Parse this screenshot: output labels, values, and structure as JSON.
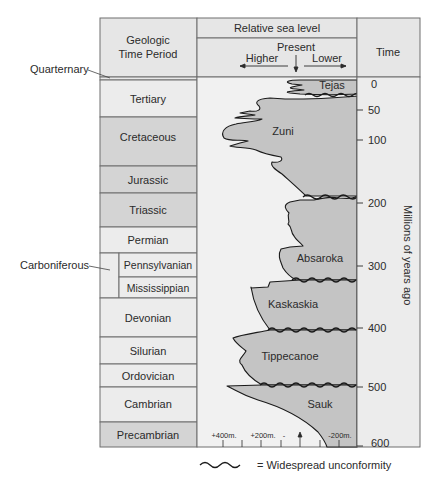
{
  "header": {
    "period_column": [
      "Geologic",
      "Time Period"
    ],
    "sea_level_title": "Relative sea level",
    "present_label": "Present",
    "higher_label": "Higher",
    "lower_label": "Lower",
    "time_label": "Time"
  },
  "side_labels": {
    "quaternary": "Quarternary",
    "carboniferous": "Carboniferous"
  },
  "periods": [
    {
      "name": "Tertiary",
      "shade": "light"
    },
    {
      "name": "Cretaceous",
      "shade": "dark"
    },
    {
      "name": "Jurassic",
      "shade": "dark"
    },
    {
      "name": "Triassic",
      "shade": "dark"
    },
    {
      "name": "Permian",
      "shade": "light"
    },
    {
      "name": "Pennsylvanian",
      "shade": "light"
    },
    {
      "name": "Mississippian",
      "shade": "light"
    },
    {
      "name": "Devonian",
      "shade": "light"
    },
    {
      "name": "Silurian",
      "shade": "light"
    },
    {
      "name": "Ordovician",
      "shade": "light"
    },
    {
      "name": "Cambrian",
      "shade": "light"
    },
    {
      "name": "Precambrian",
      "shade": "dark"
    }
  ],
  "sequences": [
    "Tejas",
    "Zuni",
    "Absaroka",
    "Kaskaskia",
    "Tippecanoe",
    "Sauk"
  ],
  "time_axis": {
    "ticks": [
      "0",
      "50",
      "100",
      "200",
      "300",
      "400",
      "500",
      "600"
    ],
    "label": "Millions of years ago"
  },
  "sea_level_axis": {
    "ticks": [
      "+400m.",
      "+200m.",
      "-",
      "-200m."
    ]
  },
  "legend": {
    "text": "= Widespread unconformity"
  },
  "colors": {
    "frame": "#6e6e6e",
    "light_cell": "#ececec",
    "dark_cell": "#d4d4d4",
    "sequence_fill": "#c8c8c8",
    "curve": "#1a1a1a"
  }
}
